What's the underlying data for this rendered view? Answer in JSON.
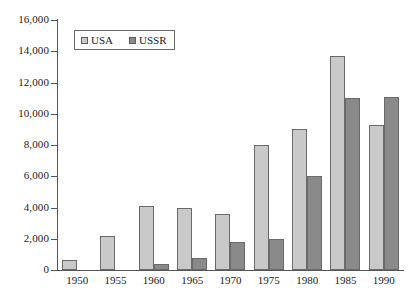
{
  "chart_data": {
    "type": "bar",
    "title": "",
    "subtitle": "",
    "xlabel": "",
    "ylabel": "",
    "categories": [
      "1950",
      "1955",
      "1960",
      "1965",
      "1970",
      "1975",
      "1980",
      "1985",
      "1990"
    ],
    "series": [
      {
        "name": "USA",
        "color": "#c9c9c9",
        "values": [
          650,
          2200,
          4100,
          4000,
          3600,
          8000,
          9000,
          13700,
          9300
        ]
      },
      {
        "name": "USSR",
        "color": "#8a8a8a",
        "values": [
          0,
          0,
          400,
          800,
          1800,
          2000,
          6000,
          11000,
          11100
        ]
      }
    ],
    "ylim": [
      0,
      16000
    ],
    "ytick_step": 2000,
    "ytick_labels": [
      "0",
      "2,000",
      "4,000",
      "6,000",
      "8,000",
      "10,000",
      "12,000",
      "14,000",
      "16,000"
    ],
    "ytick_values": [
      0,
      2000,
      4000,
      6000,
      8000,
      10000,
      12000,
      14000,
      16000
    ],
    "grid": false,
    "legend_position": "upper-left",
    "legend_entries": [
      "USA",
      "USSR"
    ],
    "annotations": []
  }
}
